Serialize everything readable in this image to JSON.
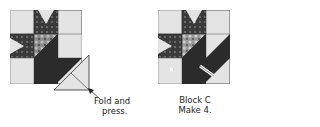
{
  "diagram": {
    "left_step": {
      "annotation": {
        "line1": "Fold and",
        "line2": "press."
      }
    },
    "right_result": {
      "caption": {
        "line1": "Block C",
        "line2": "Make 4."
      }
    }
  },
  "colors": {
    "background_fabric": "#e4e4e4",
    "dark_fabric": "#2b2b2b",
    "print_fabric": "#8c8c8c",
    "outline": "#555555"
  }
}
